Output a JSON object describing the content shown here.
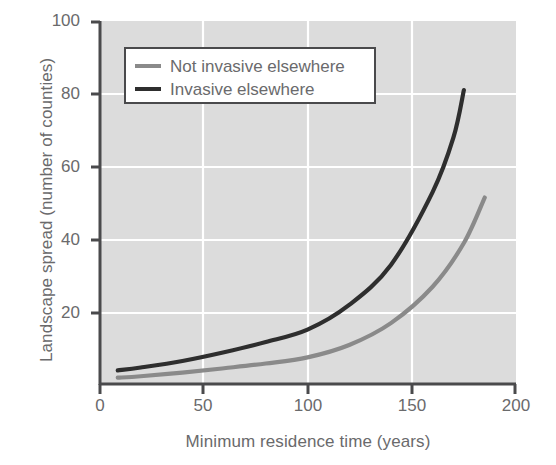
{
  "chart_data": {
    "type": "line",
    "title": "",
    "xlabel": "Minimum residence time (years)",
    "ylabel": "Landscape spread (number of counties)",
    "xlim": [
      0,
      200
    ],
    "ylim": [
      0,
      100
    ],
    "xticks": [
      0,
      50,
      100,
      150,
      200
    ],
    "yticks": [
      0,
      20,
      40,
      60,
      80,
      100
    ],
    "xtick_labels": [
      "0",
      "50",
      "100",
      "150",
      "200"
    ],
    "ytick_labels": [
      "0",
      "20",
      "40",
      "60",
      "80",
      "100"
    ],
    "grid": true,
    "grid_color": "#ffffff",
    "plot_background": "#dcdcdc",
    "legend_position": "upper left",
    "series": [
      {
        "name": "Not invasive elsewhere",
        "color": "#8a8a8a",
        "x": [
          9,
          20,
          40,
          60,
          80,
          100,
          120,
          140,
          160,
          175,
          185
        ],
        "values": [
          2.0,
          2.4,
          3.4,
          4.6,
          5.9,
          7.6,
          11.0,
          17.0,
          27.0,
          39.0,
          51.5
        ]
      },
      {
        "name": "Invasive elsewhere",
        "color": "#2e2e2e",
        "x": [
          9,
          20,
          40,
          60,
          80,
          100,
          120,
          140,
          160,
          170,
          175
        ],
        "values": [
          4.0,
          4.8,
          6.6,
          9.0,
          11.8,
          15.2,
          22.0,
          33.0,
          53.0,
          68.0,
          81.0
        ]
      }
    ]
  },
  "legend": {
    "entries": [
      {
        "label": "Not invasive elsewhere",
        "color": "#8a8a8a"
      },
      {
        "label": "Invasive elsewhere",
        "color": "#2e2e2e"
      }
    ]
  },
  "axes": {
    "x_title": "Minimum residence time (years)",
    "y_title": "Landscape spread (number of counties)",
    "x_ticks": [
      "0",
      "50",
      "100",
      "150",
      "200"
    ],
    "y_ticks": [
      "100",
      "80",
      "60",
      "40",
      "20",
      "0"
    ]
  },
  "colors": {
    "plot_bg": "#dcdcdc",
    "grid": "#ffffff",
    "axis": "#4a4a4c",
    "text": "#6a6a6c",
    "series_gray": "#8a8a8a",
    "series_dark": "#2e2e2e"
  }
}
